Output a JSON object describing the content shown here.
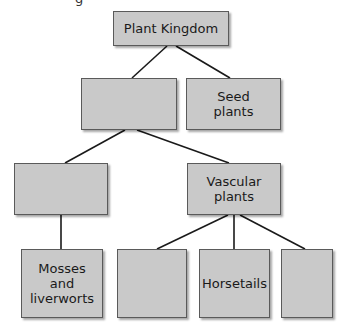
{
  "diagram": {
    "title_fragment": "g",
    "colors": {
      "box_fill": "#c9c9c9",
      "box_border": "#5a5a5a",
      "line": "#1a1a1a",
      "background": "#ffffff"
    },
    "nodes": [
      {
        "id": "plant-kingdom",
        "label": "Plant Kingdom",
        "x": 113,
        "y": 11,
        "w": 116,
        "h": 35
      },
      {
        "id": "blank-row2-left",
        "label": "",
        "x": 81,
        "y": 78,
        "w": 96,
        "h": 52
      },
      {
        "id": "seed-plants",
        "label": "Seed\nplants",
        "x": 186,
        "y": 78,
        "w": 95,
        "h": 52
      },
      {
        "id": "blank-row3-left",
        "label": "",
        "x": 14,
        "y": 163,
        "w": 94,
        "h": 52
      },
      {
        "id": "vascular-plants",
        "label": "Vascular\nplants",
        "x": 187,
        "y": 163,
        "w": 94,
        "h": 52
      },
      {
        "id": "mosses-liverworts",
        "label": "Mosses\nand\nliverworts",
        "x": 21,
        "y": 249,
        "w": 82,
        "h": 69
      },
      {
        "id": "blank-row4-2",
        "label": "",
        "x": 117,
        "y": 249,
        "w": 70,
        "h": 69
      },
      {
        "id": "horsetails",
        "label": "Horsetails",
        "x": 199,
        "y": 249,
        "w": 71,
        "h": 69
      },
      {
        "id": "blank-row4-4",
        "label": "",
        "x": 281,
        "y": 249,
        "w": 52,
        "h": 69
      }
    ],
    "edges": [
      {
        "from": "plant-kingdom",
        "to": "blank-row2-left",
        "x1": 167,
        "y1": 46,
        "x2": 132,
        "y2": 78
      },
      {
        "from": "plant-kingdom",
        "to": "seed-plants",
        "x1": 176,
        "y1": 46,
        "x2": 230,
        "y2": 78
      },
      {
        "from": "blank-row2-left",
        "to": "blank-row3-left",
        "x1": 125,
        "y1": 130,
        "x2": 65,
        "y2": 163
      },
      {
        "from": "blank-row2-left",
        "to": "vascular-plants",
        "x1": 137,
        "y1": 130,
        "x2": 229,
        "y2": 163
      },
      {
        "from": "blank-row3-left",
        "to": "mosses-liverworts",
        "x1": 61,
        "y1": 215,
        "x2": 61,
        "y2": 249
      },
      {
        "from": "vascular-plants",
        "to": "blank-row4-2",
        "x1": 228,
        "y1": 215,
        "x2": 157,
        "y2": 249
      },
      {
        "from": "vascular-plants",
        "to": "horsetails",
        "x1": 234,
        "y1": 215,
        "x2": 234,
        "y2": 249
      },
      {
        "from": "vascular-plants",
        "to": "blank-row4-4",
        "x1": 240,
        "y1": 215,
        "x2": 305,
        "y2": 249
      }
    ]
  }
}
